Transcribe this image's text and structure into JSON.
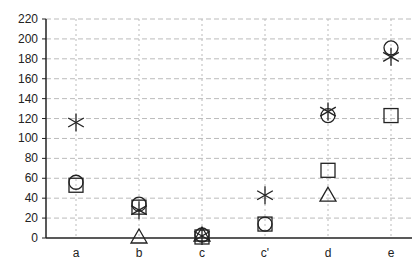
{
  "chart_data": {
    "type": "scatter",
    "title": "",
    "xlabel": "",
    "ylabel": "",
    "categories": [
      "a",
      "b",
      "c",
      "c'",
      "d",
      "e"
    ],
    "ylim": [
      0,
      220
    ],
    "yticks": [
      0,
      20,
      40,
      60,
      80,
      100,
      120,
      140,
      160,
      180,
      200,
      220
    ],
    "grid": true,
    "legend": null,
    "series": [
      {
        "name": "star",
        "marker": "asterisk",
        "values": [
          116,
          28,
          2,
          43,
          127,
          182
        ]
      },
      {
        "name": "circle",
        "marker": "circle",
        "values": [
          56,
          34,
          3,
          14,
          123,
          191
        ]
      },
      {
        "name": "square",
        "marker": "square",
        "values": [
          53,
          31,
          1,
          14,
          68,
          123
        ]
      },
      {
        "name": "triangle",
        "marker": "triangle",
        "values": [
          null,
          1,
          3,
          null,
          43,
          null
        ]
      }
    ]
  },
  "style": {
    "axis_color": "#222222",
    "grid_color": "#bbbbbb",
    "marker_color": "#222222"
  }
}
